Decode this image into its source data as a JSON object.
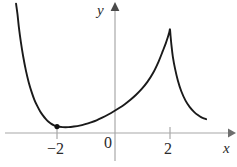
{
  "figure": {
    "title": "",
    "background_color": "#ffffff",
    "curve_color": "#1a1a1a",
    "axis_color": "#a8a8a8",
    "label_color": "#2b2b2b"
  },
  "axes": {
    "x_axis_label": "x",
    "y_axis_label": "y",
    "origin_label": "0",
    "x_ticks": [
      {
        "label": "−2",
        "value": -2
      },
      {
        "label": "2",
        "value": 2
      }
    ],
    "y_ticks": []
  },
  "chart_data": {
    "type": "line",
    "title": "",
    "xlabel": "x",
    "ylabel": "y",
    "grid": false,
    "legend": null,
    "xlim": [
      -3.6,
      3.3
    ],
    "ylim": [
      -0.55,
      4.4
    ],
    "annotations": [
      {
        "kind": "point",
        "label": "local minimum marker",
        "x": -2,
        "y": 0.22,
        "marker": "filled-circle"
      },
      {
        "kind": "cusp",
        "label": "vertical cusp / spike",
        "x": 2,
        "y": 3.5
      },
      {
        "kind": "asymptote",
        "label": "curve rises steeply at left edge",
        "x": -3.4
      }
    ],
    "series": [
      {
        "name": "curve-left-branch",
        "x": [
          -3.45,
          -3.4,
          -3.35,
          -3.28,
          -3.2,
          -3.1,
          -3.0,
          -2.9,
          -2.8,
          -2.7,
          -2.6,
          -2.5,
          -2.4,
          -2.3,
          -2.2,
          -2.1,
          -2.0
        ],
        "y": [
          4.4,
          4.05,
          3.6,
          3.1,
          2.62,
          2.12,
          1.72,
          1.4,
          1.13,
          0.92,
          0.74,
          0.6,
          0.48,
          0.38,
          0.31,
          0.26,
          0.22
        ]
      },
      {
        "name": "curve-middle-rise",
        "x": [
          -2.0,
          -1.8,
          -1.6,
          -1.4,
          -1.2,
          -1.0,
          -0.8,
          -0.6,
          -0.4,
          -0.2,
          0.0,
          0.2,
          0.4,
          0.6,
          0.8,
          1.0,
          1.2,
          1.4,
          1.6,
          1.75,
          1.85,
          1.92,
          1.96,
          1.98,
          2.0
        ],
        "y": [
          0.22,
          0.2,
          0.2,
          0.22,
          0.25,
          0.3,
          0.36,
          0.43,
          0.52,
          0.62,
          0.73,
          0.85,
          0.98,
          1.13,
          1.3,
          1.5,
          1.74,
          2.04,
          2.44,
          2.8,
          3.05,
          3.25,
          3.38,
          3.45,
          3.52
        ]
      },
      {
        "name": "curve-right-branch",
        "x": [
          2.0,
          2.02,
          2.05,
          2.1,
          2.18,
          2.28,
          2.4,
          2.55,
          2.7,
          2.85,
          3.0,
          3.1,
          3.2,
          3.28
        ],
        "y": [
          3.52,
          3.3,
          3.0,
          2.6,
          2.18,
          1.78,
          1.42,
          1.1,
          0.88,
          0.72,
          0.6,
          0.54,
          0.5,
          0.47
        ]
      }
    ]
  }
}
